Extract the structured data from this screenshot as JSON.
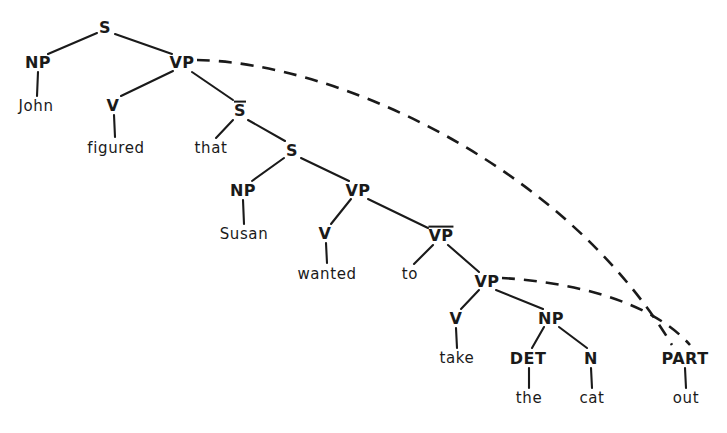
{
  "diagram": {
    "sentence": "John figured that Susan wanted to take the cat out",
    "ink_color": "#1a1a1a",
    "background_color": "#ffffff",
    "solid_branch_style": "solid",
    "movement_branch_style": "dashed"
  },
  "nodes": [
    {
      "id": "S1",
      "label": "S",
      "x": 105,
      "y": 27,
      "barred": false
    },
    {
      "id": "NP1",
      "label": "NP",
      "x": 38,
      "y": 62,
      "barred": false
    },
    {
      "id": "VP1",
      "label": "VP",
      "x": 182,
      "y": 62,
      "barred": false
    },
    {
      "id": "V1",
      "label": "V",
      "x": 113,
      "y": 105,
      "barred": false
    },
    {
      "id": "SBAR",
      "label": "S",
      "x": 240,
      "y": 110,
      "barred": true
    },
    {
      "id": "S2",
      "label": "S",
      "x": 292,
      "y": 150,
      "barred": false
    },
    {
      "id": "NP2",
      "label": "NP",
      "x": 243,
      "y": 190,
      "barred": false
    },
    {
      "id": "VP2",
      "label": "VP",
      "x": 358,
      "y": 190,
      "barred": false
    },
    {
      "id": "V2",
      "label": "V",
      "x": 325,
      "y": 233,
      "barred": false
    },
    {
      "id": "VPBAR",
      "label": "VP",
      "x": 441,
      "y": 235,
      "barred": true
    },
    {
      "id": "VP3",
      "label": "VP",
      "x": 487,
      "y": 281,
      "barred": false
    },
    {
      "id": "V3",
      "label": "V",
      "x": 456,
      "y": 318,
      "barred": false
    },
    {
      "id": "NP3",
      "label": "NP",
      "x": 551,
      "y": 318,
      "barred": false
    },
    {
      "id": "DET",
      "label": "DET",
      "x": 528,
      "y": 358,
      "barred": false
    },
    {
      "id": "N1",
      "label": "N",
      "x": 591,
      "y": 358,
      "barred": false
    },
    {
      "id": "PART",
      "label": "PART",
      "x": 685,
      "y": 358,
      "barred": false
    }
  ],
  "leaves": [
    {
      "id": "w_john",
      "label": "John",
      "x": 36,
      "y": 106
    },
    {
      "id": "w_figured",
      "label": "figured",
      "x": 116,
      "y": 148
    },
    {
      "id": "w_that",
      "label": "that",
      "x": 211,
      "y": 148
    },
    {
      "id": "w_susan",
      "label": "Susan",
      "x": 244,
      "y": 234
    },
    {
      "id": "w_wanted",
      "label": "wanted",
      "x": 327,
      "y": 274
    },
    {
      "id": "w_to",
      "label": "to",
      "x": 410,
      "y": 274
    },
    {
      "id": "w_take",
      "label": "take",
      "x": 457,
      "y": 358
    },
    {
      "id": "w_the",
      "label": "the",
      "x": 529,
      "y": 398
    },
    {
      "id": "w_cat",
      "label": "cat",
      "x": 592,
      "y": 398
    },
    {
      "id": "w_out",
      "label": "out",
      "x": 686,
      "y": 398
    }
  ],
  "solid_branches": [
    {
      "from": "S1",
      "to": "NP1",
      "x1": 97,
      "y1": 33,
      "x2": 48,
      "y2": 54
    },
    {
      "from": "S1",
      "to": "VP1",
      "x1": 115,
      "y1": 34,
      "x2": 172,
      "y2": 54
    },
    {
      "from": "NP1",
      "to": "w_john",
      "x1": 38,
      "y1": 72,
      "x2": 37,
      "y2": 96
    },
    {
      "from": "VP1",
      "to": "V1",
      "x1": 173,
      "y1": 71,
      "x2": 121,
      "y2": 96
    },
    {
      "from": "VP1",
      "to": "SBAR",
      "x1": 192,
      "y1": 72,
      "x2": 233,
      "y2": 100
    },
    {
      "from": "V1",
      "to": "w_figured",
      "x1": 114,
      "y1": 115,
      "x2": 115,
      "y2": 137
    },
    {
      "from": "SBAR",
      "to": "w_that",
      "x1": 233,
      "y1": 120,
      "x2": 216,
      "y2": 138
    },
    {
      "from": "SBAR",
      "to": "S2",
      "x1": 248,
      "y1": 120,
      "x2": 285,
      "y2": 141
    },
    {
      "from": "S2",
      "to": "NP2",
      "x1": 284,
      "y1": 158,
      "x2": 252,
      "y2": 181
    },
    {
      "from": "S2",
      "to": "VP2",
      "x1": 301,
      "y1": 158,
      "x2": 349,
      "y2": 181
    },
    {
      "from": "NP2",
      "to": "w_susan",
      "x1": 243,
      "y1": 200,
      "x2": 244,
      "y2": 224
    },
    {
      "from": "VP2",
      "to": "V2",
      "x1": 351,
      "y1": 199,
      "x2": 331,
      "y2": 224
    },
    {
      "from": "VP2",
      "to": "VPBAR",
      "x1": 368,
      "y1": 199,
      "x2": 428,
      "y2": 228
    },
    {
      "from": "V2",
      "to": "w_wanted",
      "x1": 326,
      "y1": 243,
      "x2": 327,
      "y2": 263
    },
    {
      "from": "VPBAR",
      "to": "w_to",
      "x1": 433,
      "y1": 245,
      "x2": 414,
      "y2": 264
    },
    {
      "from": "VPBAR",
      "to": "VP3",
      "x1": 448,
      "y1": 245,
      "x2": 479,
      "y2": 272
    },
    {
      "from": "VP3",
      "to": "V3",
      "x1": 479,
      "y1": 290,
      "x2": 461,
      "y2": 309
    },
    {
      "from": "VP3",
      "to": "NP3",
      "x1": 496,
      "y1": 290,
      "x2": 543,
      "y2": 309
    },
    {
      "from": "V3",
      "to": "w_take",
      "x1": 456,
      "y1": 328,
      "x2": 457,
      "y2": 348
    },
    {
      "from": "NP3",
      "to": "DET",
      "x1": 544,
      "y1": 327,
      "x2": 532,
      "y2": 348
    },
    {
      "from": "NP3",
      "to": "N1",
      "x1": 559,
      "y1": 327,
      "x2": 587,
      "y2": 348
    },
    {
      "from": "DET",
      "to": "w_the",
      "x1": 529,
      "y1": 368,
      "x2": 529,
      "y2": 388
    },
    {
      "from": "N1",
      "to": "w_cat",
      "x1": 591,
      "y1": 368,
      "x2": 592,
      "y2": 388
    },
    {
      "from": "PART",
      "to": "w_out",
      "x1": 685,
      "y1": 368,
      "x2": 686,
      "y2": 388
    }
  ],
  "movement_arcs": [
    {
      "id": "arc-vp1-part",
      "from": "VP1",
      "to": "PART",
      "path": "M 197,60 C 330,62 560,160 672,345"
    },
    {
      "id": "arc-vp3-part",
      "from": "VP3",
      "to": "PART",
      "path": "M 502,278 C 570,282 650,300 690,345"
    }
  ]
}
